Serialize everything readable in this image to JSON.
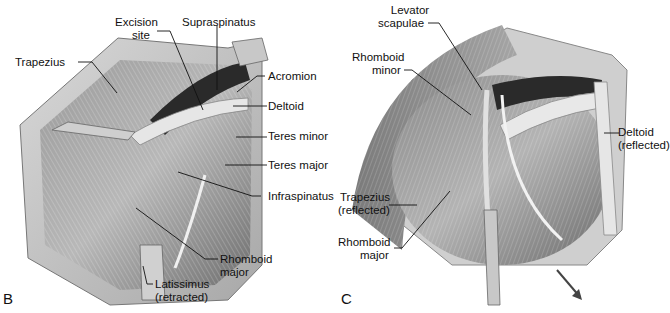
{
  "figure": {
    "panels": [
      {
        "id": "B",
        "letter": "B",
        "labels": {
          "trapezius": "Trapezius",
          "excision_site_1": "Excision",
          "excision_site_2": "site",
          "supraspinatus": "Supraspinatus",
          "acromion": "Acromion",
          "deltoid": "Deltoid",
          "teres_minor": "Teres minor",
          "teres_major": "Teres major",
          "infraspinatus": "Infraspinatus",
          "rhomboid_major_1": "Rhomboid",
          "rhomboid_major_2": "major",
          "latissimus_1": "Latissimus",
          "latissimus_2": "(retracted)"
        }
      },
      {
        "id": "C",
        "letter": "C",
        "labels": {
          "levator_1": "Levator",
          "levator_2": "scapulae",
          "rhomboid_minor_1": "Rhomboid",
          "rhomboid_minor_2": "minor",
          "deltoid_1": "Deltoid",
          "deltoid_2": "(reflected)",
          "trapezius_1": "Trapezius",
          "trapezius_2": "(reflected)",
          "rhomboid_major_1": "Rhomboid",
          "rhomboid_major_2": "major"
        }
      }
    ]
  }
}
